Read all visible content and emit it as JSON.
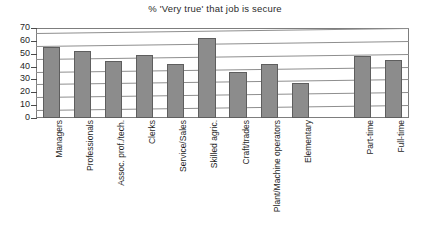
{
  "chart_data": {
    "type": "bar",
    "title": "% 'Very true' that job is secure",
    "xlabel": "",
    "ylabel": "",
    "ylim": [
      0,
      70
    ],
    "ytick_step": 10,
    "yticks": [
      70,
      60,
      50,
      40,
      30,
      20,
      10,
      0
    ],
    "grid": true,
    "legend": "none",
    "orientation": "vertical",
    "categories": [
      "Managers",
      "Professionals",
      "Assoc. prof./tech.",
      "Clerks",
      "Service/Sales",
      "Skilled agric.",
      "Craft/trades",
      "Plant/Machine operators",
      "Elementary",
      "",
      "Part-time",
      "Full-time"
    ],
    "values": [
      55,
      52,
      44,
      49,
      42,
      62,
      36,
      42,
      27,
      null,
      48,
      45
    ],
    "bar_color": "#8c8c8c",
    "bar_edge_color": "#5e5e5e"
  }
}
